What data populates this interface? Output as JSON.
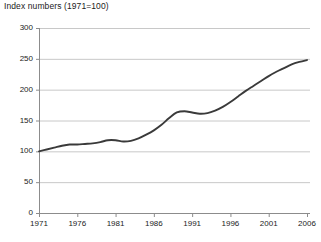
{
  "chart_data": {
    "type": "line",
    "title": "Index numbers (1971=100)",
    "xlabel": "",
    "ylabel": "",
    "xlim": [
      1971,
      2006
    ],
    "ylim": [
      0,
      300
    ],
    "grid": "horizontal",
    "legend": "none",
    "xticks": [
      1971,
      1976,
      1981,
      1986,
      1991,
      1996,
      2001,
      2006
    ],
    "xtick_labels": [
      "1971",
      "1976",
      "1981",
      "1986",
      "1991",
      "1996",
      "2001",
      "2006"
    ],
    "yticks": [
      0,
      50,
      100,
      150,
      200,
      250,
      300
    ],
    "ytick_labels": [
      "0",
      "50",
      "100",
      "150",
      "200",
      "250",
      "300"
    ],
    "line_color": "#3a3a3a",
    "grid_color": "#c8c8c8",
    "axis_color": "#8c8c8c",
    "series": [
      {
        "name": "Index",
        "x": [
          1971,
          1972,
          1973,
          1974,
          1975,
          1976,
          1977,
          1978,
          1979,
          1980,
          1981,
          1982,
          1983,
          1984,
          1985,
          1986,
          1987,
          1988,
          1989,
          1990,
          1991,
          1992,
          1993,
          1994,
          1995,
          1996,
          1997,
          1998,
          1999,
          2000,
          2001,
          2002,
          2003,
          2004,
          2005,
          2006
        ],
        "values": [
          100,
          103,
          106,
          109,
          111,
          111,
          112,
          113,
          115,
          118,
          118,
          116,
          117,
          121,
          127,
          134,
          143,
          154,
          163,
          165,
          163,
          161,
          162,
          166,
          172,
          180,
          189,
          198,
          206,
          214,
          222,
          229,
          235,
          241,
          245,
          248
        ]
      }
    ]
  }
}
